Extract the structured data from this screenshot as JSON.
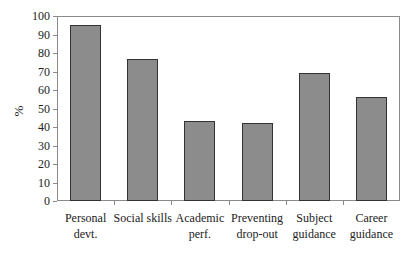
{
  "chart_data": {
    "type": "bar",
    "title": "",
    "xlabel": "",
    "ylabel": "%",
    "ylim": [
      0,
      100
    ],
    "yticks": [
      0,
      10,
      20,
      30,
      40,
      50,
      60,
      70,
      80,
      90,
      100
    ],
    "grid": false,
    "legend": null,
    "categories": [
      "Personal\ndevt.",
      "Social skills",
      "Academic\nperf.",
      "Preventing\ndrop-out",
      "Subject\nguidance",
      "Career\nguidance"
    ],
    "values": [
      95,
      77,
      43,
      42,
      69,
      56
    ],
    "bar_color": "#8c8c8c",
    "bar_edge_color": "#333333"
  }
}
